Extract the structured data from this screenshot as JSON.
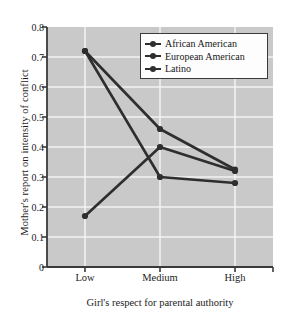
{
  "chart_data": {
    "type": "line",
    "title": "",
    "xlabel": "Girl's respect for parental authority",
    "ylabel": "Mother's report on intensity of conflict",
    "categories": [
      "Low",
      "Medium",
      "High"
    ],
    "ylim": [
      0,
      0.8
    ],
    "yticks": [
      "0",
      "0.1",
      "0.2",
      "0.3",
      "0.4",
      "0.5",
      "0.6",
      "0.7",
      "0.8"
    ],
    "ytick_values": [
      0,
      0.1,
      0.2,
      0.3,
      0.4,
      0.5,
      0.6,
      0.7,
      0.8
    ],
    "grid": true,
    "legend_position": "upper right",
    "plot_background": "#c9c9c9",
    "grid_color": "#f2f2f2",
    "series": [
      {
        "name": "African American",
        "values": [
          0.72,
          0.46,
          0.325
        ],
        "color": "#2e2e2e"
      },
      {
        "name": "European American",
        "values": [
          0.72,
          0.3,
          0.28
        ],
        "color": "#2e2e2e"
      },
      {
        "name": "Latino",
        "values": [
          0.17,
          0.4,
          0.32
        ],
        "color": "#2e2e2e"
      }
    ]
  },
  "axes": {
    "y_label": "Mother's report on intensity of conflict",
    "x_label": "Girl's respect for parental authority",
    "y_ticks": [
      "0.8",
      "0.7",
      "0.6",
      "0.5",
      "0.4",
      "0.3",
      "0.2",
      "0.1",
      "0"
    ],
    "x_ticks": [
      "Low",
      "Medium",
      "High"
    ]
  },
  "legend": {
    "items": [
      {
        "label": "African American"
      },
      {
        "label": "European American"
      },
      {
        "label": "Latino"
      }
    ]
  }
}
